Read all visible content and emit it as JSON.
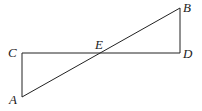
{
  "diagram": {
    "points": {
      "A": {
        "label": "A",
        "x": 22,
        "y": 97
      },
      "B": {
        "label": "B",
        "x": 180,
        "y": 8
      },
      "C": {
        "label": "C",
        "x": 22,
        "y": 53
      },
      "D": {
        "label": "D",
        "x": 180,
        "y": 53
      },
      "E": {
        "label": "E",
        "x": 101,
        "y": 53
      }
    },
    "segments": [
      "AC",
      "CD",
      "DB",
      "AB"
    ],
    "line_color": "#222222"
  }
}
